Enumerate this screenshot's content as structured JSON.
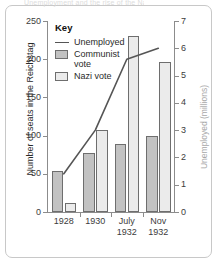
{
  "card": {
    "title_fragment": "Unemployment and the rise of the Nazis"
  },
  "legend": {
    "title": "Key",
    "items": [
      {
        "label": "Unemployed",
        "marker": "line",
        "color": "#555555"
      },
      {
        "label": "Communist vote",
        "marker": "swatch",
        "color": "#c2c2c2"
      },
      {
        "label": "Nazi vote",
        "marker": "swatch",
        "color": "#ebebeb"
      }
    ]
  },
  "axes": {
    "left": {
      "title": "Number of seats in the Reichstag",
      "ticks": [
        "0",
        "50",
        "100",
        "150",
        "200",
        "250"
      ],
      "min": 0,
      "max": 250
    },
    "right": {
      "title": "Unemployed (millions)",
      "ticks": [
        "0",
        "1",
        "2",
        "3",
        "4",
        "5",
        "6",
        "7"
      ],
      "min": 0,
      "max": 7
    },
    "x": {
      "categories": [
        "1928",
        "1930",
        "July\n1932",
        "Nov\n1932"
      ]
    }
  },
  "chart_data": {
    "type": "bar",
    "title": "Unemployment and the rise of the Nazis",
    "categories": [
      "1928",
      "1930",
      "July 1932",
      "Nov 1932"
    ],
    "xlabel": "",
    "ylabel": "Number of seats in the Reichstag",
    "ylabel_secondary": "Unemployed (millions)",
    "ylim": [
      0,
      250
    ],
    "ylim_secondary": [
      0,
      7
    ],
    "grid": false,
    "legend_position": "inside-top-left",
    "series": [
      {
        "name": "Communist vote",
        "type": "bar",
        "axis": "left",
        "unit": "seats",
        "color": "#c2c2c2",
        "values": [
          54,
          77,
          89,
          100
        ]
      },
      {
        "name": "Nazi vote",
        "type": "bar",
        "axis": "left",
        "unit": "seats",
        "color": "#ebebeb",
        "values": [
          12,
          107,
          230,
          196
        ]
      },
      {
        "name": "Unemployed",
        "type": "line",
        "axis": "right",
        "unit": "millions",
        "color": "#555555",
        "values": [
          1.4,
          3.0,
          5.6,
          6.0
        ]
      }
    ]
  }
}
